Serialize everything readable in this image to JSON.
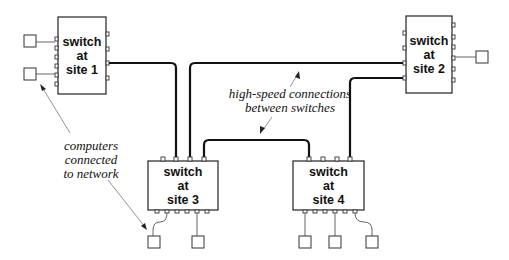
{
  "switches": [
    {
      "id": "site1",
      "line1": "switch",
      "line2": "at",
      "line3": "site 1"
    },
    {
      "id": "site2",
      "line1": "switch",
      "line2": "at",
      "line3": "site 2"
    },
    {
      "id": "site3",
      "line1": "switch",
      "line2": "at",
      "line3": "site 3"
    },
    {
      "id": "site4",
      "line1": "switch",
      "line2": "at",
      "line3": "site 4"
    }
  ],
  "annotations": {
    "high_speed": {
      "line1": "high-speed connections",
      "line2": "between switches"
    },
    "computers": {
      "line1": "computers",
      "line2": "connected",
      "line3": "to network"
    }
  },
  "colors": {
    "link": "#111111",
    "wire": "#666666",
    "arrow": "#777777"
  }
}
